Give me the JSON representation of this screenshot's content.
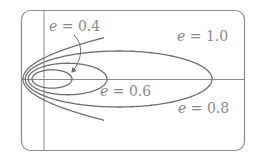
{
  "diagram": {
    "title": "",
    "type": "conic sections by eccentricity",
    "colors": {
      "curve": "#6e6e6e",
      "axis": "#8c8c8c",
      "frame": "#8c8c8c",
      "label": "#8a8a8a",
      "background": "#ffffff"
    },
    "focus_px": [
      44,
      79
    ],
    "directrix_distance_px": 42,
    "y_scale": 0.5,
    "curves": [
      {
        "e": 0.4,
        "kind": "ellipse",
        "label": "e = 0.4"
      },
      {
        "e": 0.6,
        "kind": "ellipse",
        "label": "e = 0.6"
      },
      {
        "e": 0.8,
        "kind": "ellipse",
        "label": "e = 0.8"
      },
      {
        "e": 1.0,
        "kind": "parabola",
        "label": "e = 1.0"
      }
    ],
    "labels": [
      {
        "var": "e",
        "rest": " = 0.4",
        "x": 49,
        "y": 31
      },
      {
        "var": "e",
        "rest": " = 1.0",
        "x": 177,
        "y": 41
      },
      {
        "var": "e",
        "rest": " = 0.6",
        "x": 100,
        "y": 96
      },
      {
        "var": "e",
        "rest": " = 0.8",
        "x": 178,
        "y": 113
      }
    ],
    "arrow": {
      "from_label": "e = 0.4",
      "to_curve": "e = 0.4"
    }
  }
}
